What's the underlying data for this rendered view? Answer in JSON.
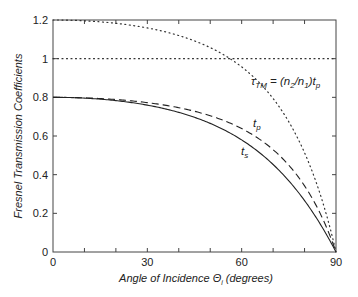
{
  "chart_data": {
    "type": "line",
    "title": "",
    "xlabel": "Angle of Incidence Θ",
    "xlabel_sub": "i",
    "xlabel_suffix": " (degrees)",
    "ylabel": "Fresnel Transmission Coefficients",
    "xlim": [
      0,
      90
    ],
    "ylim": [
      0,
      1.2
    ],
    "grid": false,
    "legend": "inline labels",
    "x_ticks": [
      0,
      30,
      60,
      90
    ],
    "x_minor_ticks": [
      10,
      20,
      40,
      50,
      70,
      80
    ],
    "y_ticks": [
      0,
      0.2,
      0.4,
      0.6,
      0.8,
      1,
      1.2
    ],
    "y_tick_labels": [
      "0",
      "0.2",
      "0.4",
      "0.6",
      "0.8",
      "1",
      "1.2"
    ],
    "x_tick_labels": [
      "0",
      "30",
      "60",
      "90"
    ],
    "x": [
      0,
      10,
      20,
      30,
      40,
      50,
      60,
      70,
      80,
      85,
      90
    ],
    "series": [
      {
        "name": "t_s",
        "style": "solid",
        "values": [
          0.8,
          0.796,
          0.783,
          0.76,
          0.722,
          0.665,
          0.58,
          0.453,
          0.266,
          0.144,
          0.0
        ]
      },
      {
        "name": "t_p",
        "style": "dashed",
        "values": [
          0.8,
          0.797,
          0.789,
          0.773,
          0.746,
          0.705,
          0.638,
          0.529,
          0.342,
          0.199,
          0.0
        ]
      },
      {
        "name": "τ_TM = (n2/n1) t_p",
        "style": "dotted",
        "values": [
          1.2,
          1.196,
          1.183,
          1.159,
          1.12,
          1.057,
          0.958,
          0.794,
          0.513,
          0.298,
          0.0
        ]
      },
      {
        "name": "reference line y=1",
        "style": "dotted",
        "values": [
          1,
          1,
          1,
          1,
          1,
          1,
          1,
          1,
          1,
          1,
          1
        ]
      }
    ],
    "annotations": [
      {
        "text": "τ",
        "sub": "TM",
        "rest": " = (n",
        "sub2": "2",
        "mid": "/n",
        "sub3": "1",
        "end": ")t",
        "sub4": "p"
      },
      {
        "text": "t",
        "sub": "p"
      },
      {
        "text": "t",
        "sub": "s"
      }
    ]
  }
}
